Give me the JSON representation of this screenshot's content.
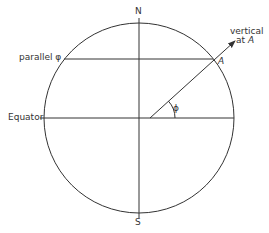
{
  "diagram": {
    "type": "geometry",
    "colors": {
      "line": "#333333",
      "text": "#333333",
      "background": "#ffffff"
    },
    "labels": {
      "north": "N",
      "south": "S",
      "parallel": "parallel φ",
      "equator": "Equator",
      "vertical_line1": "vertical",
      "vertical_line2_prefix": "at ",
      "vertical_line2_point": "A",
      "point": "A",
      "angle": "ϕ"
    }
  }
}
